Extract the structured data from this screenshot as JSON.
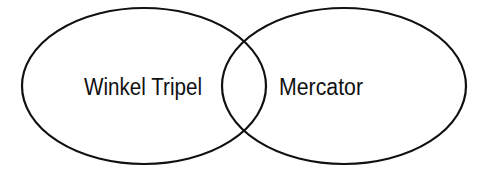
{
  "diagram": {
    "type": "venn",
    "sets": [
      {
        "label": "Winkel Tripel"
      },
      {
        "label": "Mercator"
      }
    ],
    "stroke_color": "#111111",
    "background": "#ffffff"
  }
}
